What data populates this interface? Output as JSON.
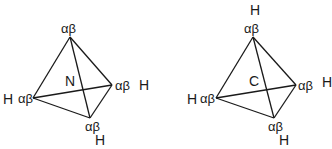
{
  "diagrams": [
    {
      "name": "nitrogen-tetrahedron",
      "center_label": "N",
      "vertices": {
        "top": {
          "label": "αβ",
          "substituent": ""
        },
        "right": {
          "label": "αβ",
          "substituent": "H"
        },
        "left": {
          "label": "αβ",
          "substituent": "H"
        },
        "bottom": {
          "label": "αβ",
          "substituent": "H"
        }
      }
    },
    {
      "name": "carbon-tetrahedron",
      "center_label": "C",
      "vertices": {
        "top": {
          "label": "αβ",
          "substituent": "H"
        },
        "right": {
          "label": "αβ",
          "substituent": "H"
        },
        "left": {
          "label": "αβ",
          "substituent": "H"
        },
        "bottom": {
          "label": "αβ",
          "substituent": "H"
        }
      }
    }
  ]
}
